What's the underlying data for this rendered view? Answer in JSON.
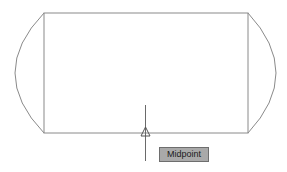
{
  "drawing": {
    "rectangle": {
      "x1": 44,
      "y1": 13,
      "x2": 248,
      "y2": 133
    },
    "arcs": [
      {
        "side": "left",
        "apex_x": 15
      },
      {
        "side": "right",
        "apex_x": 276
      }
    ],
    "line_color": "#8a8a8a"
  },
  "cursor": {
    "x": 145,
    "y_top": 105,
    "y_bottom": 161
  },
  "snap_marker": {
    "type": "midpoint-triangle",
    "x": 145,
    "y": 133
  },
  "tooltip": {
    "label": "Midpoint",
    "bg_color": "#a9a9a9"
  }
}
